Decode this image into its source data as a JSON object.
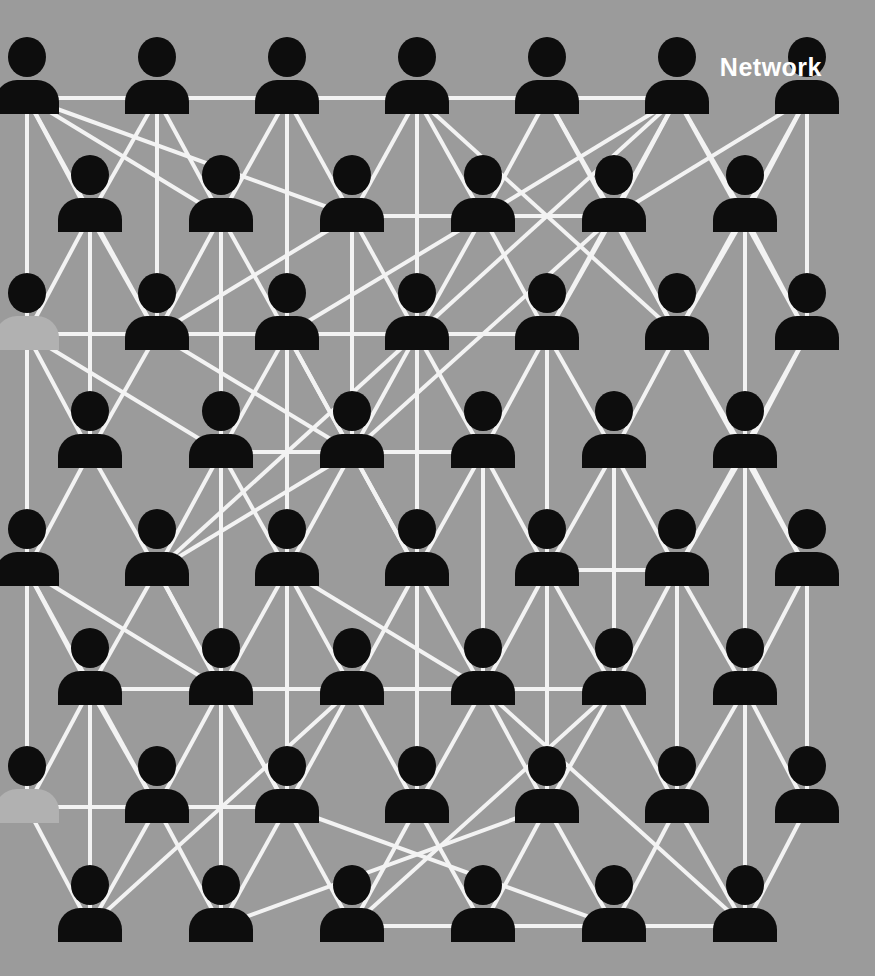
{
  "canvas": {
    "width": 875,
    "height": 976,
    "background": "#9b9b9b"
  },
  "title": {
    "label": "Network",
    "color": "#ffffff",
    "font_size": 25,
    "x": 822,
    "y": 76,
    "align": "end"
  },
  "network": {
    "style": {
      "icon_color": "#0d0d0d",
      "muted_body_color": "#b1b1b1",
      "line_color": "#f3f3f3",
      "line_width": 4,
      "head_rx": 19,
      "head_ry": 20,
      "body_half_width": 32,
      "body_top_offset": 23,
      "body_bottom_offset": 57,
      "shoulder_radius": 22,
      "anchor_offset": 41
    },
    "rows": [
      {
        "id": "r1",
        "head_y": 57,
        "x": [
          27,
          157,
          287,
          417,
          547,
          677,
          807
        ]
      },
      {
        "id": "r2",
        "head_y": 175,
        "x": [
          90,
          221,
          352,
          483,
          614,
          745
        ]
      },
      {
        "id": "r3",
        "head_y": 293,
        "x": [
          27,
          157,
          287,
          417,
          547,
          677,
          807
        ]
      },
      {
        "id": "r4",
        "head_y": 411,
        "x": [
          90,
          221,
          352,
          483,
          614,
          745
        ]
      },
      {
        "id": "r5",
        "head_y": 529,
        "x": [
          27,
          157,
          287,
          417,
          547,
          677,
          807
        ]
      },
      {
        "id": "r6",
        "head_y": 648,
        "x": [
          90,
          221,
          352,
          483,
          614,
          745
        ]
      },
      {
        "id": "r7",
        "head_y": 766,
        "x": [
          27,
          157,
          287,
          417,
          547,
          677,
          807
        ]
      },
      {
        "id": "r8",
        "head_y": 885,
        "x": [
          90,
          221,
          352,
          483,
          614,
          745
        ]
      }
    ],
    "muted_nodes": [
      "r3c0",
      "r7c0"
    ],
    "edges": [
      "r1c0-r1c5",
      "r2c2-r2c4",
      "r3c0-r3c4",
      "r4c1-r4c3",
      "r5c4-r5c5",
      "r6c0-r6c4",
      "r7c0-r7c2",
      "r8c2-r8c5",
      "r1c0-r7c0",
      "r1c3-r7c3",
      "r3c2-r5c2",
      "r3c4-r7c4",
      "r2c5-r6c5",
      "r5c6-r7c6",
      "r1c1-r3c1",
      "r1c0-r2c0",
      "r1c0-r2c1",
      "r1c0-r2c2",
      "r1c0-r3c1",
      "r1c1-r2c0",
      "r1c1-r2c1",
      "r1c2-r2c1",
      "r1c2-r2c2",
      "r1c2-r3c2",
      "r1c3-r2c2",
      "r1c3-r2c3",
      "r1c3-r3c5",
      "r1c4-r2c3",
      "r1c4-r2c4",
      "r1c4-r3c5",
      "r1c5-r2c3",
      "r1c5-r2c4",
      "r1c5-r2c5",
      "r1c5-r3c4",
      "r1c5-r3c3",
      "r1c5-r3c6",
      "r1c6-r2c4",
      "r1c6-r2c5",
      "r1c6-r3c5",
      "r1c6-r3c6",
      "r2c0-r3c0",
      "r2c0-r3c1",
      "r2c0-r4c0",
      "r2c1-r3c1",
      "r2c1-r3c2",
      "r2c1-r4c1",
      "r2c2-r3c1",
      "r2c2-r3c3",
      "r2c2-r4c2",
      "r2c3-r3c2",
      "r2c3-r3c3",
      "r2c3-r3c4",
      "r2c4-r3c4",
      "r2c4-r3c5",
      "r2c4-r4c2",
      "r2c5-r3c5",
      "r2c5-r3c6",
      "r2c5-r4c5",
      "r3c0-r4c0",
      "r3c0-r4c1",
      "r3c1-r4c0",
      "r3c1-r4c2",
      "r3c2-r4c1",
      "r3c2-r4c2",
      "r3c2-r5c3",
      "r3c3-r4c2",
      "r3c3-r4c3",
      "r3c3-r5c1",
      "r3c4-r4c3",
      "r3c4-r4c4",
      "r3c5-r4c4",
      "r3c5-r4c5",
      "r3c5-r5c6",
      "r3c6-r4c5",
      "r3c6-r5c5",
      "r4c0-r5c0",
      "r4c0-r5c1",
      "r4c1-r5c1",
      "r4c1-r5c2",
      "r4c1-r6c1",
      "r4c2-r5c1",
      "r4c2-r5c2",
      "r4c2-r5c3",
      "r4c3-r5c3",
      "r4c3-r5c4",
      "r4c3-r6c3",
      "r4c4-r5c4",
      "r4c4-r5c5",
      "r4c4-r6c4",
      "r4c5-r5c5",
      "r4c5-r5c6",
      "r5c0-r6c0",
      "r5c0-r6c1",
      "r5c0-r7c1",
      "r5c1-r6c0",
      "r5c1-r6c1",
      "r5c1-r7c2",
      "r5c2-r6c1",
      "r5c2-r6c2",
      "r5c2-r6c3",
      "r5c2-r7c2",
      "r5c3-r6c2",
      "r5c3-r6c3",
      "r5c4-r6c3",
      "r5c4-r6c4",
      "r5c5-r6c4",
      "r5c5-r6c5",
      "r5c5-r7c5",
      "r5c6-r6c5",
      "r6c0-r7c0",
      "r6c0-r7c1",
      "r6c0-r8c0",
      "r6c1-r7c1",
      "r6c1-r7c2",
      "r6c1-r8c1",
      "r6c2-r7c2",
      "r6c2-r7c3",
      "r6c2-r8c0",
      "r6c3-r7c3",
      "r6c3-r7c4",
      "r6c3-r8c5",
      "r6c4-r7c4",
      "r6c4-r7c5",
      "r6c4-r8c2",
      "r6c5-r7c5",
      "r6c5-r7c6",
      "r6c5-r8c5",
      "r7c0-r8c0",
      "r7c1-r8c0",
      "r7c1-r8c1",
      "r7c2-r8c1",
      "r7c2-r8c2",
      "r7c2-r8c4",
      "r7c3-r8c2",
      "r7c3-r8c3",
      "r7c4-r8c3",
      "r7c4-r8c4",
      "r7c4-r8c1",
      "r7c5-r8c4",
      "r7c5-r8c5",
      "r7c6-r8c5"
    ]
  }
}
